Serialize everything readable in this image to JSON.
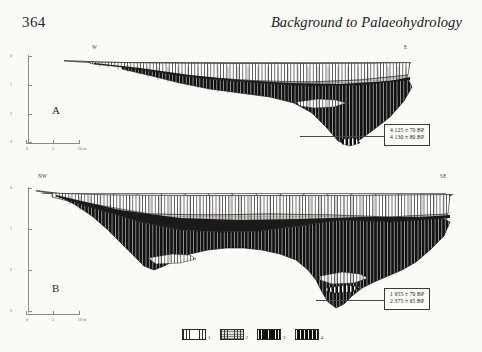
{
  "page": {
    "folio": "364",
    "running_head": "Background to Palaeohydrology"
  },
  "sections": [
    {
      "id": "A",
      "label": "A",
      "left_compass": "W",
      "right_compass": "E",
      "horizontal_ticks": [
        "1",
        "2",
        "3",
        "4",
        "5",
        "6",
        "7",
        "8",
        "9",
        "10",
        "11"
      ],
      "depth_ticks": [
        "0",
        "1",
        "2",
        "3"
      ],
      "depth_unit": "m",
      "scale_bar": {
        "labels": [
          "0",
          "5",
          "10 m"
        ]
      },
      "dates": [
        "4 125  ±  70 BP",
        "4 130  ±  80 BP"
      ]
    },
    {
      "id": "B",
      "label": "B",
      "left_compass": "NW",
      "right_compass": "SE",
      "horizontal_ticks": [
        "1",
        "2",
        "3",
        "4",
        "5",
        "6",
        "7",
        "8",
        "9",
        "10",
        "11",
        "12",
        "13",
        "14",
        "15",
        "16"
      ],
      "depth_ticks": [
        "0",
        "1",
        "2",
        "3"
      ],
      "depth_unit": "m",
      "scale_bar": {
        "labels": [
          "0",
          "5",
          "10 m"
        ]
      },
      "dates": [
        "1 955  ±  70 BP",
        "2 375  ±  65 BP"
      ]
    }
  ],
  "legend": {
    "items": [
      {
        "number": "1",
        "pattern": "light-vertical-hatch"
      },
      {
        "number": "2",
        "pattern": "stippled-vertical-hatch"
      },
      {
        "number": "3",
        "pattern": "solid-black"
      },
      {
        "number": "4",
        "pattern": "black-white-stripe"
      }
    ]
  },
  "colors": {
    "ink": "#1b1b1b",
    "paper": "#fbfaf7",
    "rule": "#8a8a8a",
    "fill_dark": "#111111",
    "fill_light": "#fefefe",
    "fill_stipple": "#e4e2dd"
  }
}
